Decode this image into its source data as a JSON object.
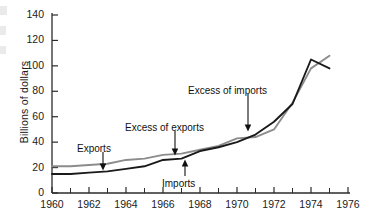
{
  "chart_data": {
    "type": "line",
    "title": "",
    "xlabel": "",
    "ylabel": "Billions of dollars",
    "xlim": [
      1960,
      1976
    ],
    "ylim": [
      0,
      140
    ],
    "grid": false,
    "legend_position": "inline-annotations",
    "x_tick_labels": [
      "1960",
      "1962",
      "1964",
      "1966",
      "1968",
      "1970",
      "1972",
      "1974",
      "1976"
    ],
    "x_tick_values": [
      1960,
      1962,
      1964,
      1966,
      1968,
      1970,
      1972,
      1974,
      1976
    ],
    "x_minor_ticks": [
      1961,
      1963,
      1965,
      1967,
      1969,
      1971,
      1973,
      1975
    ],
    "y_tick_labels": [
      "0",
      "20",
      "40",
      "60",
      "80",
      "100",
      "120",
      "140"
    ],
    "y_tick_values": [
      0,
      20,
      40,
      60,
      80,
      100,
      120,
      140
    ],
    "x": [
      1960,
      1961,
      1962,
      1963,
      1964,
      1965,
      1966,
      1967,
      1968,
      1969,
      1970,
      1971,
      1972,
      1973,
      1974,
      1975
    ],
    "series": [
      {
        "name": "Exports",
        "color": "#8c8c8c",
        "values": [
          21,
          21,
          22,
          23,
          26,
          27,
          30,
          31,
          34,
          37,
          43,
          44,
          50,
          71,
          98,
          108
        ]
      },
      {
        "name": "Imports",
        "color": "#1a1a1a",
        "values": [
          15,
          15,
          16,
          17,
          19,
          21,
          26,
          27,
          33,
          36,
          40,
          46,
          56,
          70,
          105,
          98
        ]
      }
    ],
    "annotations": [
      {
        "text": "Exports",
        "label_x": 77,
        "label_y": 143,
        "arrow_from_x": 103,
        "arrow_from_y": 152,
        "arrow_to_x": 103,
        "arrow_to_y": 167
      },
      {
        "text": "Imports",
        "label_x": 162,
        "label_y": 178,
        "arrow_from_x": 185,
        "arrow_from_y": 176,
        "arrow_to_x": 185,
        "arrow_to_y": 163
      },
      {
        "text": "Excess of exports",
        "label_x": 125,
        "label_y": 122,
        "arrow_from_x": 175,
        "arrow_from_y": 131,
        "arrow_to_x": 175,
        "arrow_to_y": 152
      },
      {
        "text": "Excess of imports",
        "label_x": 188,
        "label_y": 85,
        "arrow_from_x": 248,
        "arrow_from_y": 94,
        "arrow_to_x": 248,
        "arrow_to_y": 128
      }
    ]
  },
  "axis": {
    "y_label": "Billions of dollars"
  }
}
